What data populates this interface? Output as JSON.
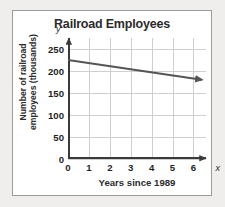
{
  "chart_data": {
    "type": "line",
    "title": "Railroad Employees",
    "xlabel": "Years since 1989",
    "ylabel": "Number of railroad employees (thousands)",
    "ylabel_line1": "Number of railroad",
    "ylabel_line2": "employees (thousands)",
    "axis_letter_x": "x",
    "axis_letter_y": "y",
    "xlim": [
      0,
      6.6
    ],
    "ylim": [
      0,
      275
    ],
    "grid": true,
    "legend": false,
    "x_ticks": [
      0,
      1,
      2,
      3,
      4,
      5,
      6
    ],
    "x_tick_labels": [
      "0",
      "1",
      "2",
      "3",
      "4",
      "5",
      "6"
    ],
    "y_ticks": [
      0,
      50,
      100,
      150,
      200,
      250
    ],
    "y_tick_labels": [
      "0",
      "50",
      "100",
      "150",
      "200",
      "250"
    ],
    "series": [
      {
        "name": "Railroad employees",
        "style": "solid-line-with-arrow",
        "color": "#555555",
        "x": [
          0,
          6.4
        ],
        "values": [
          225,
          180
        ]
      }
    ],
    "slope_per_year": -7.03,
    "intercept": 225
  },
  "figure": {
    "card_border_color": "#9a9a9a",
    "background_color": "#f0eeec",
    "plot_background_color": "#ffffff",
    "grid_color": "#cfcfcf",
    "axis_color": "#3a3a3a"
  }
}
